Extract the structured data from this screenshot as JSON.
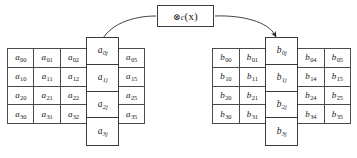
{
  "diagram": {
    "operator": {
      "symbol": "⊗",
      "subscript": "c",
      "argument": "(x)",
      "full_label": "⊗c (x)"
    },
    "colors": {
      "background": "#ffffff",
      "grid_line": "#4a4a4a",
      "highlight_border": "#3a3a3a",
      "arrow": "#2b2b2b",
      "text": "#1a1a1a"
    },
    "left_matrix": {
      "name": "matrix-a",
      "symbol": "a",
      "left_block": {
        "columns": [
          "0",
          "1",
          "2"
        ],
        "rows": [
          [
            {
              "base": "a",
              "sub": "00"
            },
            {
              "base": "a",
              "sub": "01"
            },
            {
              "base": "a",
              "sub": "02"
            }
          ],
          [
            {
              "base": "a",
              "sub": "10"
            },
            {
              "base": "a",
              "sub": "11"
            },
            {
              "base": "a",
              "sub": "12"
            }
          ],
          [
            {
              "base": "a",
              "sub": "20"
            },
            {
              "base": "a",
              "sub": "21"
            },
            {
              "base": "a",
              "sub": "22"
            }
          ],
          [
            {
              "base": "a",
              "sub": "30"
            },
            {
              "base": "a",
              "sub": "31"
            },
            {
              "base": "a",
              "sub": "32"
            }
          ]
        ]
      },
      "highlighted_column": {
        "label": "column j of a",
        "cells": [
          {
            "base": "a",
            "sub": "0j"
          },
          {
            "base": "a",
            "sub": "1j"
          },
          {
            "base": "a",
            "sub": "2j"
          },
          {
            "base": "a",
            "sub": "3j"
          }
        ]
      },
      "right_block": {
        "columns": [
          "5"
        ],
        "rows": [
          [
            {
              "base": "a",
              "sub": "05"
            }
          ],
          [
            {
              "base": "a",
              "sub": "15"
            }
          ],
          [
            {
              "base": "a",
              "sub": "25"
            }
          ],
          [
            {
              "base": "a",
              "sub": "35"
            }
          ]
        ]
      }
    },
    "right_matrix": {
      "name": "matrix-b",
      "symbol": "b",
      "left_block": {
        "columns": [
          "0",
          "1"
        ],
        "rows": [
          [
            {
              "base": "b",
              "sub": "00"
            },
            {
              "base": "b",
              "sub": "01"
            }
          ],
          [
            {
              "base": "b",
              "sub": "10"
            },
            {
              "base": "b",
              "sub": "11"
            }
          ],
          [
            {
              "base": "b",
              "sub": "20"
            },
            {
              "base": "b",
              "sub": "21"
            }
          ],
          [
            {
              "base": "b",
              "sub": "30"
            },
            {
              "base": "b",
              "sub": "31"
            }
          ]
        ]
      },
      "highlighted_column": {
        "label": "column j of b",
        "cells": [
          {
            "base": "b",
            "sub": "0j"
          },
          {
            "base": "b",
            "sub": "1j"
          },
          {
            "base": "b",
            "sub": "2j"
          },
          {
            "base": "b",
            "sub": "3j"
          }
        ]
      },
      "right_block": {
        "columns": [
          "4",
          "5"
        ],
        "rows": [
          [
            {
              "base": "b",
              "sub": "04"
            },
            {
              "base": "b",
              "sub": "05"
            }
          ],
          [
            {
              "base": "b",
              "sub": "14"
            },
            {
              "base": "b",
              "sub": "15"
            }
          ],
          [
            {
              "base": "b",
              "sub": "24"
            },
            {
              "base": "b",
              "sub": "25"
            }
          ],
          [
            {
              "base": "b",
              "sub": "34"
            },
            {
              "base": "b",
              "sub": "35"
            }
          ]
        ]
      }
    },
    "connectors": [
      {
        "name": "input-link",
        "from": "left-highlighted-column",
        "to": "operator-box",
        "arrowhead": false
      },
      {
        "name": "output-arrow",
        "from": "operator-box",
        "to": "right-highlighted-column",
        "arrowhead": true
      }
    ]
  }
}
